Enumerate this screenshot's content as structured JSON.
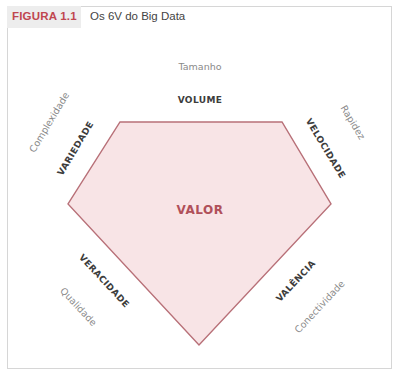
{
  "header": {
    "figure_number": "FIGURA 1.1",
    "title": "Os 6V do Big Data"
  },
  "diagram": {
    "center_label": "VALOR",
    "colors": {
      "accent": "#c0464f",
      "polygon_fill": "#f8e4e6",
      "polygon_stroke": "#b87078",
      "center_text": "#b0505a"
    },
    "sides": [
      {
        "v": "VOLUME",
        "meaning": "Tamanho",
        "position": "top"
      },
      {
        "v": "VELOCIDADE",
        "meaning": "Rapidez",
        "position": "upper-right"
      },
      {
        "v": "VALÊNCIA",
        "meaning": "Conectividade",
        "position": "lower-right"
      },
      {
        "v": "VERACIDADE",
        "meaning": "Qualidade",
        "position": "lower-left"
      },
      {
        "v": "VARIEDADE",
        "meaning": "Complexidade",
        "position": "upper-left"
      }
    ]
  }
}
